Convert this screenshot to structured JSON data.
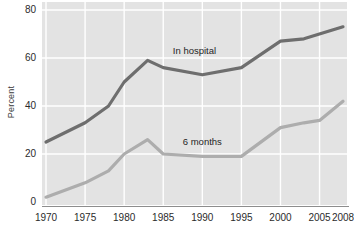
{
  "chart_data": {
    "type": "line",
    "title": "",
    "subtitle": "",
    "xlabel": "",
    "ylabel": "Percent",
    "xlim": [
      1970,
      2008
    ],
    "ylim": [
      0,
      80
    ],
    "grid": true,
    "grid_color": "#ffffff",
    "plot_background": "#e3e3e3",
    "legend_position": "inline-annotation",
    "y_ticks": [
      {
        "value": 80,
        "label": "80"
      },
      {
        "value": 60,
        "label": "60"
      },
      {
        "value": 40,
        "label": "40"
      },
      {
        "value": 20,
        "label": "20"
      },
      {
        "value": 0,
        "label": "0"
      }
    ],
    "x_ticks": [
      {
        "value": 1970,
        "label": "1970"
      },
      {
        "value": 1975,
        "label": "1975"
      },
      {
        "value": 1980,
        "label": "1980"
      },
      {
        "value": 1985,
        "label": "1985"
      },
      {
        "value": 1990,
        "label": "1990"
      },
      {
        "value": 1995,
        "label": "1995"
      },
      {
        "value": 2000,
        "label": "2000"
      },
      {
        "value": 2005,
        "label": "2005"
      },
      {
        "value": 2008,
        "label": "2008"
      }
    ],
    "series": [
      {
        "name": "In hospital",
        "color": "#6e6e6e",
        "x": [
          1970,
          1975,
          1978,
          1980,
          1983,
          1985,
          1990,
          1995,
          2000,
          2003,
          2008
        ],
        "values": [
          25,
          33,
          40,
          50,
          59,
          56,
          53,
          56,
          67,
          68,
          73
        ],
        "annotation": {
          "text": "In hospital",
          "x": 1989,
          "y": 63
        }
      },
      {
        "name": "6 months",
        "color": "#adadad",
        "x": [
          1970,
          1975,
          1978,
          1980,
          1983,
          1985,
          1990,
          1995,
          2000,
          2003,
          2005,
          2008
        ],
        "values": [
          2,
          8,
          13,
          20,
          26,
          20,
          19,
          19,
          31,
          33,
          34,
          42
        ],
        "annotation": {
          "text": "6 months",
          "x": 1990,
          "y": 25
        }
      }
    ]
  },
  "axis": {
    "y_title": "Percent"
  }
}
